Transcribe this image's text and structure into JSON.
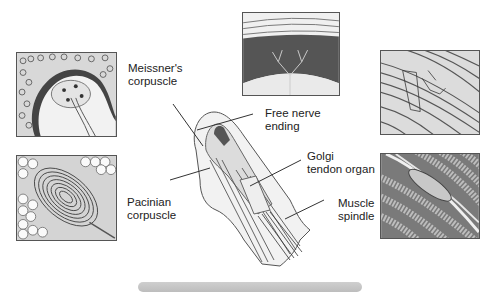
{
  "figure": {
    "labels": {
      "meissner": "Meissner's\ncorpuscle",
      "free_nerve": "Free nerve\nending",
      "golgi": "Golgi\ntendon organ",
      "pacinian": "Pacinian\ncorpuscle",
      "muscle_spindle": "Muscle\nspindle"
    },
    "panels": [
      {
        "id": "meissner-corpuscle-panel",
        "depicts": "Meissner's corpuscle in dermal papilla"
      },
      {
        "id": "free-nerve-ending-panel",
        "depicts": "Free nerve endings in epidermis"
      },
      {
        "id": "golgi-tendon-organ-panel",
        "depicts": "Golgi tendon organ in tendon fibers"
      },
      {
        "id": "pacinian-corpuscle-panel",
        "depicts": "Pacinian corpuscle lamellae among fat cells"
      },
      {
        "id": "muscle-spindle-panel",
        "depicts": "Muscle spindle among muscle fibers"
      }
    ],
    "center_illustration": "Fingertip cross-section with receptors",
    "colors": {
      "line": "#333333",
      "panel_border": "#555555",
      "bar": "#c8c8c8"
    }
  }
}
